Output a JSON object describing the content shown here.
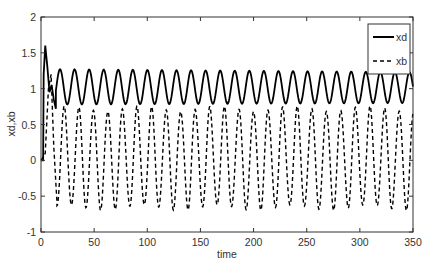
{
  "chart_data": {
    "type": "line",
    "title": "",
    "xlabel": "time",
    "ylabel": "xd,xb",
    "xlim": [
      0,
      350
    ],
    "ylim": [
      -1,
      2
    ],
    "xticks": [
      0,
      50,
      100,
      150,
      200,
      250,
      300,
      350
    ],
    "xtick_labels": [
      "0",
      "50",
      "100",
      "150",
      "200",
      "250",
      "300",
      "350"
    ],
    "yticks": [
      -1,
      -0.5,
      0,
      0.5,
      1,
      1.5,
      2
    ],
    "ytick_labels": [
      "-1",
      "-0.5",
      "0",
      "0.5",
      "1",
      "1.5",
      "2"
    ],
    "grid": false,
    "legend_position": "upper right",
    "series": [
      {
        "name": "xd",
        "style": "solid",
        "color": "#000000",
        "description": "Starts at 0, jumps to ~1.6 near t=0, settles into oscillation around ~1.02 with period ~13.7",
        "initial_points": [
          [
            0,
            0
          ],
          [
            2,
            0
          ],
          [
            2.5,
            1.2
          ],
          [
            4,
            1.6
          ],
          [
            6,
            1.3
          ],
          [
            8,
            0.95
          ],
          [
            10,
            1.05
          ],
          [
            12,
            0.85
          ],
          [
            14,
            0.72
          ]
        ],
        "oscillation": {
          "t_start": 18,
          "first_peak_t": 17.9,
          "period": 13.7,
          "peak_start": 1.27,
          "peak_end": 1.23,
          "trough_start": 0.78,
          "trough_end": 0.8
        }
      },
      {
        "name": "xb",
        "style": "dashed",
        "color": "#000000",
        "description": "Starts at 0, peaks ~1.2 near t=9, then oscillates between ~0.7 and ~-0.65 with period ~13.7, roughly in anti-phase with xd",
        "initial_points": [
          [
            0,
            0
          ],
          [
            4,
            0.1
          ],
          [
            7,
            1.0
          ],
          [
            9.5,
            1.2
          ],
          [
            12,
            0.2
          ],
          [
            15,
            -0.58
          ]
        ],
        "oscillation": {
          "t_start": 15,
          "first_trough_t": 15,
          "period": 13.7,
          "peak": 0.72,
          "trough": -0.66
        }
      }
    ]
  },
  "legend": {
    "items": [
      {
        "label": "xd",
        "style": "solid"
      },
      {
        "label": "xb",
        "style": "dashed"
      }
    ]
  }
}
